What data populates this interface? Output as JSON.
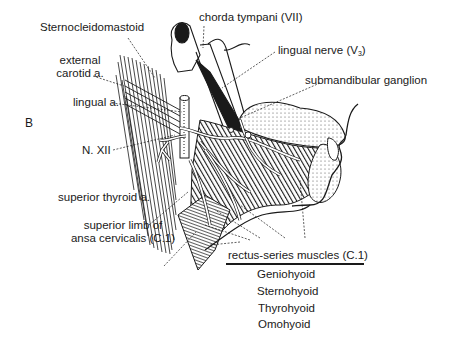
{
  "figure": {
    "panel_letter": "B",
    "labels": {
      "sternocleidomastoid": "Sternocleidomastoid",
      "chorda_tympani": "chorda tympani (VII)",
      "external_carotid_line1": "external",
      "external_carotid_line2": "carotid a.",
      "lingual_nerve": "lingual nerve (V",
      "lingual_nerve_sub": "3",
      "lingual_nerve_close": ")",
      "lingual_artery": "lingual a.",
      "submandibular_ganglion": "submandibular ganglion",
      "hypoglossal": "N. XII",
      "superior_thyroid": "superior thyroid a.",
      "ansa_line1": "superior limb of",
      "ansa_line2": "ansa cervicalis (C.1)"
    },
    "muscle_group": {
      "heading": "rectus-series muscles (C.1)",
      "items": [
        "Geniohyoid",
        "Sternohyoid",
        "Thyrohyoid",
        "Omohyoid"
      ]
    },
    "colors": {
      "ink": "#1a1a1a",
      "background": "#ffffff"
    }
  }
}
